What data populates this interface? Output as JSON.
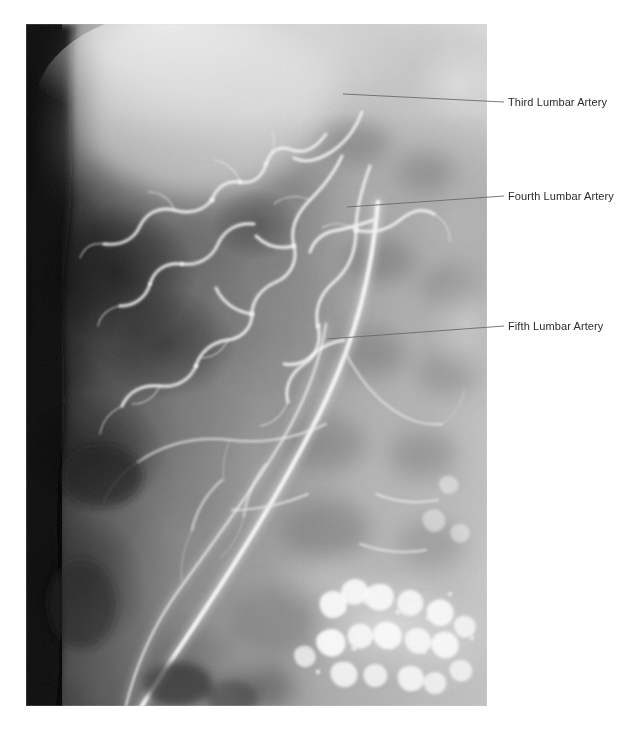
{
  "figure": {
    "type": "angiogram",
    "modality": "catheter-angiography",
    "background_color": "#ffffff",
    "plate": {
      "left": 26,
      "top": 24,
      "width": 461,
      "height": 682
    }
  },
  "annotations": [
    {
      "id": "third-lumbar-artery",
      "label": "Third Lumbar Artery",
      "text_x": 508,
      "text_y": 96,
      "leader": {
        "x1": 343,
        "y1": 94,
        "x2": 504,
        "y2": 102
      },
      "color": "#2b2b2b",
      "line_color": "#6b6b6b"
    },
    {
      "id": "fourth-lumbar-artery",
      "label": "Fourth Lumbar Artery",
      "text_x": 508,
      "text_y": 190,
      "leader": {
        "x1": 347,
        "y1": 207,
        "x2": 504,
        "y2": 196
      },
      "color": "#2b2b2b",
      "line_color": "#6b6b6b"
    },
    {
      "id": "fifth-lumbar-artery",
      "label": "Fifth Lumbar Artery",
      "text_x": 508,
      "text_y": 320,
      "leader": {
        "x1": 327,
        "y1": 339,
        "x2": 504,
        "y2": 326
      },
      "color": "#2b2b2b",
      "line_color": "#6b6b6b"
    }
  ],
  "image_regions": {
    "dark_left_margin": "dark vertical band along the left edge of the plate",
    "bright_upper_left": "bright contrast-filled soft-tissue region upper left",
    "lumbar_arterial_network": "tortuous small-calibre lumbar artery branches in the upper-middle field",
    "iliac_vessel": "bright diagonal vessel running from upper right to lower left",
    "calcified_cluster": "cluster of bright calcific densities in the lower right quadrant",
    "vertebral_column": "vertebral bodies and transverse processes in the right-of-midline field"
  }
}
